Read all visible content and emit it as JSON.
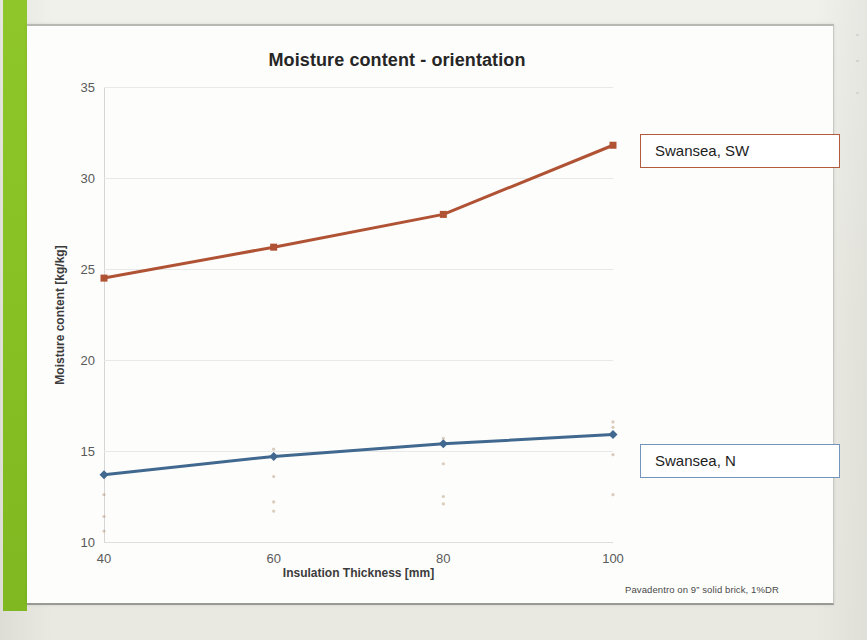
{
  "slide": {
    "accent_color": "#8cc426",
    "card_background": "#fdfdfb"
  },
  "chart_data": {
    "type": "line",
    "title": "Moisture content - orientation",
    "xlabel": "Insulation Thickness [mm]",
    "ylabel": "Moisture content [kg/kg]",
    "categories": [
      "40",
      "60",
      "80",
      "100"
    ],
    "x": [
      40,
      60,
      80,
      100
    ],
    "xlim": [
      40,
      100
    ],
    "ylim": [
      10,
      35
    ],
    "yticks": [
      "35",
      "30",
      "25",
      "20",
      "15",
      "10"
    ],
    "ytick_values": [
      35,
      30,
      25,
      20,
      15,
      10
    ],
    "xticks": [
      "40",
      "60",
      "80",
      "100"
    ],
    "grid": true,
    "legend_position": "right-inline-callouts",
    "series": [
      {
        "name": "Swansea, SW",
        "color": "#b05234",
        "marker": "square",
        "values": [
          24.5,
          26.2,
          28.0,
          31.8
        ]
      },
      {
        "name": "Swansea, N",
        "color": "#41688f",
        "marker": "diamond",
        "values": [
          13.7,
          14.7,
          15.4,
          15.9
        ]
      }
    ],
    "annotation": "Pavadentro on 9” solid brick, 1%DR"
  },
  "legend": {
    "sw": {
      "label": "Swansea, SW",
      "border_color": "#b45a3c"
    },
    "n": {
      "label": "Swansea, N",
      "border_color": "#7395bd"
    }
  },
  "footnote": {
    "text": "Pavadentro on 9” solid brick, 1%DR"
  }
}
